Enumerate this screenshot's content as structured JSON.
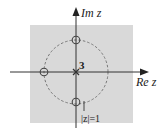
{
  "diagram": {
    "type": "pole-zero plot (z-plane)",
    "axes": {
      "x_label": "Re z",
      "y_label": "Im z"
    },
    "unit_circle_label": "|z|=1",
    "pole": {
      "location": "z = 0",
      "order_label": "3",
      "marker": "x"
    },
    "zeros": [
      {
        "location": "z = j",
        "marker": "o"
      },
      {
        "location": "z = -1",
        "marker": "o"
      },
      {
        "location": "z = -j",
        "marker": "o"
      }
    ],
    "colors": {
      "region_fill": "#d9d9d9",
      "axes": "#333333",
      "circle": "#777777",
      "markers": "#444444"
    }
  }
}
